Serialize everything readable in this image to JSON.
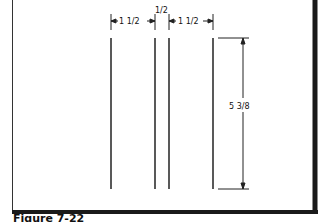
{
  "figure": {
    "caption": "Figure 7-22",
    "border_color": "#1a1a1a",
    "line_color": "#222222"
  },
  "dimensions": {
    "left_spacing": "1 1/2",
    "gap": "1/2",
    "right_spacing": "1 1/2",
    "height": "5 3/8"
  },
  "lines": [
    {
      "x": 111,
      "y1": 38,
      "y2": 189
    },
    {
      "x": 155,
      "y1": 38,
      "y2": 189
    },
    {
      "x": 169,
      "y1": 38,
      "y2": 189
    },
    {
      "x": 213,
      "y1": 38,
      "y2": 189
    }
  ]
}
